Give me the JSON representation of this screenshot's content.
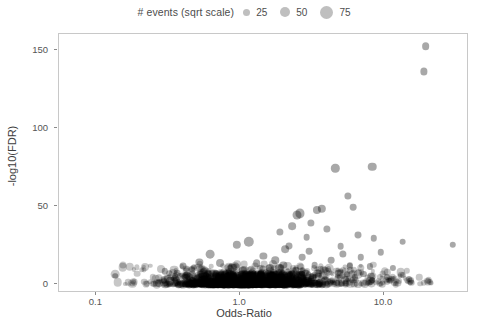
{
  "legend": {
    "title": "# events (sqrt scale)",
    "position": "top-center",
    "entries": [
      {
        "label": "25",
        "size_px": 7
      },
      {
        "label": "50",
        "size_px": 10
      },
      {
        "label": "75",
        "size_px": 13
      }
    ]
  },
  "chart_data": {
    "type": "scatter",
    "title": "",
    "xlabel": "Odds-Ratio",
    "ylabel": "-log10(FDR)",
    "xscale": "log10",
    "yscale": "linear",
    "xlim": [
      0.055,
      39
    ],
    "ylim": [
      -6,
      160
    ],
    "xticks": [
      0.1,
      1.0,
      10.0
    ],
    "xtick_labels": [
      "0.1",
      "1.0",
      "10.0"
    ],
    "yticks": [
      0,
      50,
      100,
      150
    ],
    "ytick_labels": [
      "0",
      "50",
      "100",
      "150"
    ],
    "grid": false,
    "size_legend_title": "# events (sqrt scale)",
    "size_scale": "sqrt",
    "marker_color": "#000000",
    "marker_opacity": 0.35,
    "panel_border_color": "#c8c8c8",
    "points": [
      {
        "x": 19.5,
        "y": 152,
        "n": 34
      },
      {
        "x": 19.0,
        "y": 136,
        "n": 30
      },
      {
        "x": 8.3,
        "y": 75,
        "n": 42
      },
      {
        "x": 4.6,
        "y": 74,
        "n": 40
      },
      {
        "x": 5.6,
        "y": 56,
        "n": 30
      },
      {
        "x": 6.1,
        "y": 49,
        "n": 26
      },
      {
        "x": 3.7,
        "y": 48,
        "n": 40
      },
      {
        "x": 3.4,
        "y": 47,
        "n": 38
      },
      {
        "x": 2.6,
        "y": 45,
        "n": 48
      },
      {
        "x": 2.5,
        "y": 44,
        "n": 46
      },
      {
        "x": 3.1,
        "y": 39,
        "n": 30
      },
      {
        "x": 2.3,
        "y": 37,
        "n": 34
      },
      {
        "x": 4.0,
        "y": 35,
        "n": 30
      },
      {
        "x": 1.9,
        "y": 33,
        "n": 30
      },
      {
        "x": 6.6,
        "y": 31,
        "n": 28
      },
      {
        "x": 2.9,
        "y": 30,
        "n": 26
      },
      {
        "x": 8.5,
        "y": 29,
        "n": 24
      },
      {
        "x": 13.5,
        "y": 27,
        "n": 26
      },
      {
        "x": 30.0,
        "y": 25,
        "n": 24
      },
      {
        "x": 5.0,
        "y": 24,
        "n": 26
      },
      {
        "x": 1.15,
        "y": 27,
        "n": 62
      },
      {
        "x": 0.95,
        "y": 25,
        "n": 40
      },
      {
        "x": 2.2,
        "y": 24,
        "n": 28
      },
      {
        "x": 2.05,
        "y": 22,
        "n": 34
      },
      {
        "x": 3.0,
        "y": 21,
        "n": 26
      },
      {
        "x": 9.5,
        "y": 20,
        "n": 24
      },
      {
        "x": 5.2,
        "y": 19,
        "n": 30
      },
      {
        "x": 6.9,
        "y": 17,
        "n": 24
      },
      {
        "x": 0.62,
        "y": 19,
        "n": 44
      },
      {
        "x": 1.45,
        "y": 18,
        "n": 30
      },
      {
        "x": 2.7,
        "y": 17,
        "n": 26
      },
      {
        "x": 4.3,
        "y": 15,
        "n": 26
      },
      {
        "x": 1.75,
        "y": 15,
        "n": 32
      },
      {
        "x": 0.52,
        "y": 14,
        "n": 30
      },
      {
        "x": 0.72,
        "y": 13,
        "n": 36
      },
      {
        "x": 1.3,
        "y": 13,
        "n": 34
      },
      {
        "x": 2.0,
        "y": 12,
        "n": 30
      },
      {
        "x": 3.3,
        "y": 12,
        "n": 26
      },
      {
        "x": 5.8,
        "y": 11,
        "n": 24
      },
      {
        "x": 8.0,
        "y": 11,
        "n": 22
      },
      {
        "x": 11.5,
        "y": 10,
        "n": 22
      },
      {
        "x": 0.4,
        "y": 11,
        "n": 28
      },
      {
        "x": 0.88,
        "y": 10,
        "n": 40
      },
      {
        "x": 1.6,
        "y": 10,
        "n": 38
      },
      {
        "x": 2.45,
        "y": 9,
        "n": 30
      },
      {
        "x": 3.9,
        "y": 9,
        "n": 26
      },
      {
        "x": 0.3,
        "y": 8,
        "n": 24
      },
      {
        "x": 0.56,
        "y": 8,
        "n": 30
      },
      {
        "x": 1.05,
        "y": 8,
        "n": 46
      },
      {
        "x": 1.85,
        "y": 7,
        "n": 34
      },
      {
        "x": 2.85,
        "y": 7,
        "n": 28
      },
      {
        "x": 4.8,
        "y": 7,
        "n": 24
      },
      {
        "x": 7.2,
        "y": 6,
        "n": 22
      },
      {
        "x": 0.135,
        "y": 5,
        "n": 18
      },
      {
        "x": 0.35,
        "y": 5,
        "n": 22
      },
      {
        "x": 0.68,
        "y": 5,
        "n": 30
      },
      {
        "x": 1.25,
        "y": 5,
        "n": 42
      },
      {
        "x": 2.15,
        "y": 5,
        "n": 30
      },
      {
        "x": 3.5,
        "y": 5,
        "n": 24
      },
      {
        "x": 6.3,
        "y": 4,
        "n": 22
      },
      {
        "x": 10.5,
        "y": 4,
        "n": 20
      },
      {
        "x": 15.0,
        "y": 3,
        "n": 20
      }
    ]
  },
  "axes": {
    "x": {
      "label": "Odds-Ratio",
      "ticks": [
        "0.1",
        "1.0",
        "10.0"
      ]
    },
    "y": {
      "label": "-log10(FDR)",
      "ticks": [
        "150",
        "100",
        "50",
        "0"
      ]
    }
  }
}
